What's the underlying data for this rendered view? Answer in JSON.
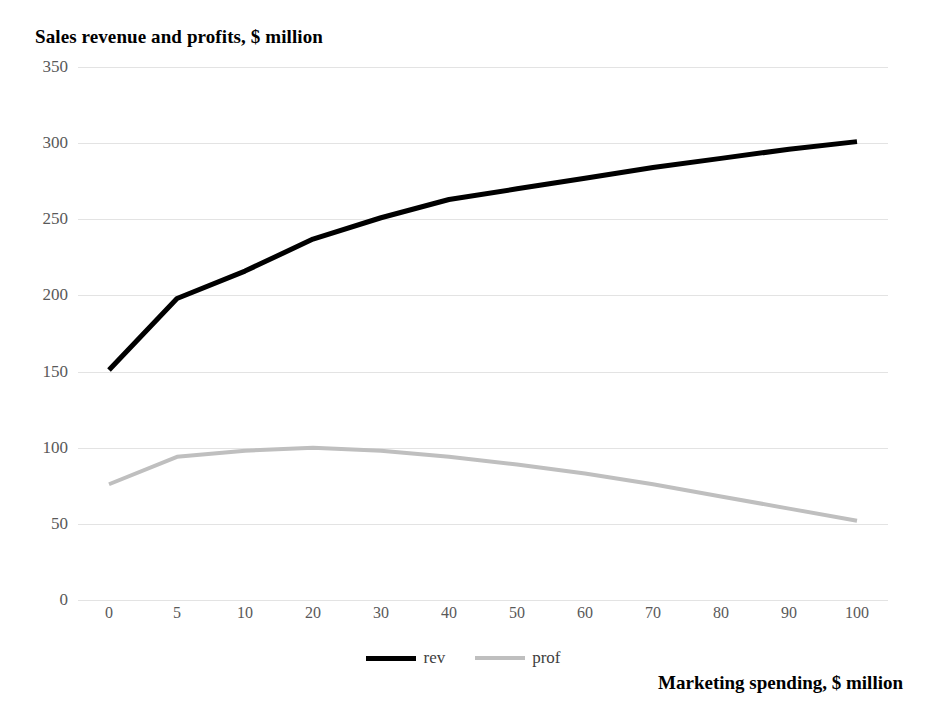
{
  "chart_data": {
    "type": "line",
    "title": "Sales revenue and profits, $ million",
    "xlabel": "Marketing spending, $ million",
    "ylabel": "",
    "categories": [
      "0",
      "5",
      "10",
      "20",
      "30",
      "40",
      "50",
      "60",
      "70",
      "80",
      "90",
      "100"
    ],
    "series": [
      {
        "name": "rev",
        "color": "#000000",
        "width": 5,
        "values": [
          151,
          198,
          216,
          237,
          251,
          263,
          270,
          277,
          284,
          290,
          296,
          301
        ]
      },
      {
        "name": "prof",
        "color": "#bfbfbf",
        "width": 4,
        "values": [
          76,
          94,
          98,
          100,
          98,
          94,
          89,
          83,
          76,
          68,
          60,
          52
        ]
      }
    ],
    "ylim": [
      0,
      350
    ],
    "ytick_values": [
      0,
      50,
      100,
      150,
      200,
      250,
      300,
      350
    ],
    "ytick_labels": [
      "0",
      "50",
      "100",
      "150",
      "200",
      "250",
      "300",
      "350"
    ],
    "grid": true,
    "legend_position": "bottom",
    "grid_color": "#e3e3e3",
    "tick_label_color": "#595959"
  },
  "legend": {
    "items": [
      {
        "label": "rev"
      },
      {
        "label": "prof"
      }
    ]
  }
}
